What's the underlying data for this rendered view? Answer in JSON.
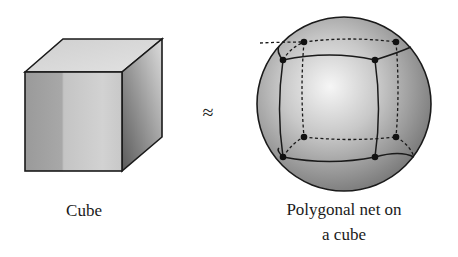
{
  "figure": {
    "left": {
      "label": "Cube"
    },
    "relation": {
      "symbol": "≈"
    },
    "right": {
      "label_line1": "Polygonal net on",
      "label_line2": "a cube"
    }
  },
  "colors": {
    "outline": "#1a1a1a",
    "cube_top": "#d8d8d8",
    "cube_front_light": "#cfcfcf",
    "cube_front_dark": "#8f8f8f",
    "cube_side": "#6e6e6e",
    "sphere_highlight": "#f4f4f4",
    "sphere_edge": "#7a7a7a"
  }
}
